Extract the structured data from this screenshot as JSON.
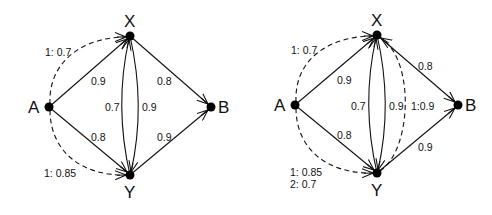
{
  "diagrams": [
    {
      "id": "left",
      "nodes": [
        {
          "id": "A",
          "label": "A"
        },
        {
          "id": "X",
          "label": "X"
        },
        {
          "id": "Y",
          "label": "Y"
        },
        {
          "id": "B",
          "label": "B"
        }
      ],
      "edges": [
        {
          "from": "A",
          "to": "X",
          "label": "0.9",
          "style": "solid"
        },
        {
          "from": "A",
          "to": "Y",
          "label": "0.8",
          "style": "solid"
        },
        {
          "from": "X",
          "to": "B",
          "label": "0.8",
          "style": "solid"
        },
        {
          "from": "Y",
          "to": "B",
          "label": "0.9",
          "style": "solid"
        },
        {
          "from": "Y",
          "to": "X",
          "label": "0.7",
          "style": "solid"
        },
        {
          "from": "X",
          "to": "Y",
          "label": "0.9",
          "style": "solid"
        },
        {
          "from": "A",
          "to": "X",
          "label": "1: 0.7",
          "style": "dashed"
        },
        {
          "from": "A",
          "to": "Y",
          "label": "1: 0.85",
          "style": "dashed"
        }
      ]
    },
    {
      "id": "right",
      "nodes": [
        {
          "id": "A",
          "label": "A"
        },
        {
          "id": "X",
          "label": "X"
        },
        {
          "id": "Y",
          "label": "Y"
        },
        {
          "id": "B",
          "label": "B"
        }
      ],
      "edges": [
        {
          "from": "A",
          "to": "X",
          "label": "0.9",
          "style": "solid"
        },
        {
          "from": "A",
          "to": "Y",
          "label": "0.8",
          "style": "solid"
        },
        {
          "from": "X",
          "to": "B",
          "label": "0.8",
          "style": "solid"
        },
        {
          "from": "Y",
          "to": "B",
          "label": "0.9",
          "style": "solid"
        },
        {
          "from": "Y",
          "to": "X",
          "label": "0.7",
          "style": "solid"
        },
        {
          "from": "X",
          "to": "Y",
          "label": "0.9",
          "style": "solid"
        },
        {
          "from": "A",
          "to": "X",
          "label": "1: 0.7",
          "style": "dashed"
        },
        {
          "from": "A",
          "to": "Y",
          "label": "1: 0.85",
          "label2": "2: 0.7",
          "style": "dashed"
        },
        {
          "from": "Y",
          "to": "X",
          "label": "1:0.9",
          "style": "dashed"
        }
      ]
    }
  ]
}
